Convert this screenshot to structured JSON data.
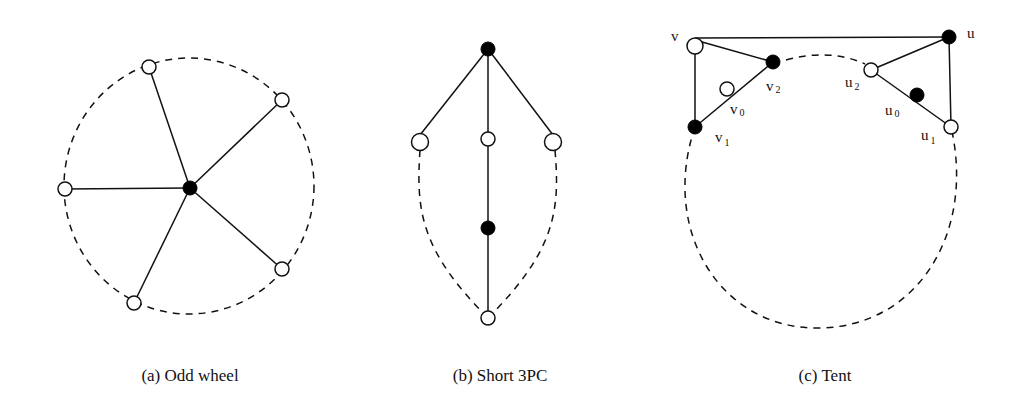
{
  "figures": [
    {
      "id": "a",
      "caption": "(a) Odd wheel",
      "hub": {
        "x": 190,
        "y": 188,
        "fill": "black"
      },
      "rim": [
        {
          "x": 149,
          "y": 67,
          "fill": "white"
        },
        {
          "x": 282,
          "y": 100,
          "fill": "white"
        },
        {
          "x": 282,
          "y": 269,
          "fill": "white"
        },
        {
          "x": 134,
          "y": 303,
          "fill": "white"
        },
        {
          "x": 65,
          "y": 189,
          "fill": "white"
        }
      ],
      "cycle": {
        "cx": 189,
        "cy": 186,
        "rx": 126,
        "ry": 128,
        "style": "dashed"
      }
    },
    {
      "id": "b",
      "caption": "(b) Short 3PC",
      "nodes": [
        {
          "name": "top",
          "x": 488,
          "y": 49,
          "fill": "black"
        },
        {
          "name": "left",
          "x": 420,
          "y": 142,
          "fill": "white"
        },
        {
          "name": "middle",
          "x": 488,
          "y": 139,
          "fill": "white"
        },
        {
          "name": "right",
          "x": 553,
          "y": 142,
          "fill": "white"
        },
        {
          "name": "inner",
          "x": 488,
          "y": 228,
          "fill": "black"
        },
        {
          "name": "bottom",
          "x": 488,
          "y": 318,
          "fill": "white"
        }
      ]
    },
    {
      "id": "c",
      "caption": "(c) Tent",
      "labels": {
        "v": "v",
        "v0": "v",
        "v0_sub": "0",
        "v1": "v",
        "v1_sub": "1",
        "v2": "v",
        "v2_sub": "2",
        "u": "u",
        "u0": "u",
        "u0_sub": "0",
        "u1": "u",
        "u1_sub": "1",
        "u2": "u",
        "u2_sub": "2"
      },
      "nodes": [
        {
          "name": "v",
          "x": 695,
          "y": 47,
          "fill": "white"
        },
        {
          "name": "v2",
          "x": 773,
          "y": 62,
          "fill": "black"
        },
        {
          "name": "v0",
          "x": 727,
          "y": 89,
          "fill": "white"
        },
        {
          "name": "v1",
          "x": 695,
          "y": 127,
          "fill": "black"
        },
        {
          "name": "u",
          "x": 949,
          "y": 37,
          "fill": "black"
        },
        {
          "name": "u2",
          "x": 871,
          "y": 70,
          "fill": "white"
        },
        {
          "name": "u0",
          "x": 917,
          "y": 95,
          "fill": "black"
        },
        {
          "name": "u1",
          "x": 951,
          "y": 127,
          "fill": "white"
        }
      ]
    }
  ]
}
